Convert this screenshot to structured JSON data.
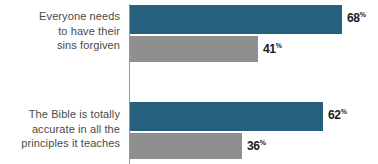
{
  "chart_data": {
    "type": "bar",
    "orientation": "horizontal",
    "title": "",
    "subtitle": "",
    "xlabel": "",
    "ylabel": "",
    "xlim": [
      0,
      80
    ],
    "grid": false,
    "legend": false,
    "legend_position": "none",
    "value_suffix": "%",
    "categories": [
      "Everyone needs to have their sins forgiven",
      "The Bible is totally accurate in all the principles it teaches"
    ],
    "category_lines": [
      [
        "Everyone needs",
        "to have their",
        "sins forgiven"
      ],
      [
        "The Bible is totally",
        "accurate in all the",
        "principles it teaches"
      ]
    ],
    "series": [
      {
        "name": "series-1",
        "color": "#25607f",
        "values": [
          68,
          62
        ]
      },
      {
        "name": "series-2",
        "color": "#8f8f8f",
        "values": [
          41,
          36
        ]
      }
    ],
    "value_labels": [
      [
        {
          "number": "68",
          "suffix": "%"
        },
        {
          "number": "41",
          "suffix": "%"
        }
      ],
      [
        {
          "number": "62",
          "suffix": "%"
        },
        {
          "number": "36",
          "suffix": "%"
        }
      ]
    ],
    "colors": {
      "primary": "#25607f",
      "secondary": "#8f8f8f",
      "label_text": "#4a4a4a",
      "value_text": "#1c1c1c",
      "axis_line": "#9a9a9a",
      "background": "#ffffff"
    }
  }
}
